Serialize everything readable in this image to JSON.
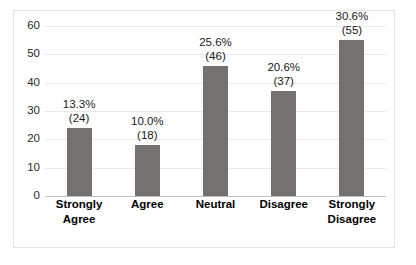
{
  "chart_data": {
    "type": "bar",
    "title": "",
    "xlabel": "",
    "ylabel": "",
    "categories": [
      "Strongly Agree",
      "Agree",
      "Neutral",
      "Disagree",
      "Strongly Disagree"
    ],
    "category_lines": [
      [
        "Strongly",
        "Agree"
      ],
      [
        "Agree"
      ],
      [
        "Neutral"
      ],
      [
        "Disagree"
      ],
      [
        "Strongly",
        "Disagree"
      ]
    ],
    "values": [
      24,
      18,
      46,
      37,
      55
    ],
    "percents": [
      "13.3%",
      "10.0%",
      "25.6%",
      "20.6%",
      "30.6%"
    ],
    "counts": [
      "(24)",
      "(18)",
      "(46)",
      "(37)",
      "(55)"
    ],
    "ylim": [
      0,
      60
    ],
    "yticks": [
      60,
      50,
      40,
      30,
      20,
      10,
      0
    ],
    "ytick_labels": [
      "60",
      "50",
      "40",
      "30",
      "20",
      "10",
      "0"
    ],
    "grid": true,
    "legend": "none",
    "bar_color": "#767171",
    "gridline_color": "#e8e8e8",
    "axis_color": "#bfbfbf",
    "border_color": "#e3e3e3",
    "background": "#ffffff"
  }
}
